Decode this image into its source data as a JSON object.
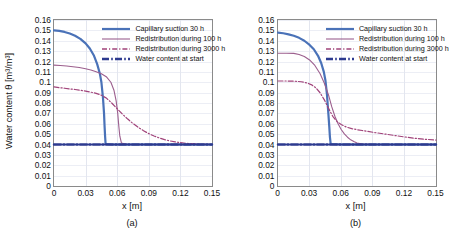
{
  "figure": {
    "axis_titles": {
      "x": "x [m]",
      "y": "Water content θ [m³/m³]"
    },
    "colors": {
      "capillary": "#4a72b8",
      "redistribution100": "#9c5f8e",
      "redistribution3000": "#a0437a",
      "start": "#2d3a8f",
      "frame": "#8a8a8a",
      "grid": "#e3e6ef",
      "background": "#ffffff"
    },
    "legend_entries": [
      {
        "label": "Capillary suction 30 h",
        "key": "capillary",
        "style": "solid-thick"
      },
      {
        "label": "Redistribution during 100 h",
        "key": "redistribution100",
        "style": "solid-thin"
      },
      {
        "label": "Redistribution during 3000 h",
        "key": "redistribution3000",
        "style": "dash-dot"
      },
      {
        "label": "Water content at start",
        "key": "start",
        "style": "dash-dot-thick"
      }
    ],
    "ticks": {
      "y": [
        "0",
        "0.01",
        "0.02",
        "0.03",
        "0.04",
        "0.05",
        "0.06",
        "0.07",
        "0.08",
        "0.09",
        "0.1",
        "0.11",
        "0.12",
        "0.13",
        "0.14",
        "0.15",
        "0.16"
      ],
      "x": [
        "0",
        "0.03",
        "0.06",
        "0.09",
        "0.12",
        "0.15"
      ]
    },
    "captions": {
      "a": "(a)",
      "b": "(b)"
    }
  },
  "chart_data": [
    {
      "type": "line",
      "panel": "(a)",
      "title": "",
      "xlabel": "x [m]",
      "ylabel": "Water content θ [m³/m³]",
      "xlim": [
        0,
        0.15
      ],
      "ylim": [
        0,
        0.16
      ],
      "xticks": [
        0,
        0.03,
        0.06,
        0.09,
        0.12,
        0.15
      ],
      "yticks": [
        0,
        0.01,
        0.02,
        0.03,
        0.04,
        0.05,
        0.06,
        0.07,
        0.08,
        0.09,
        0.1,
        0.11,
        0.12,
        0.13,
        0.14,
        0.15,
        0.16
      ],
      "grid": true,
      "legend_position": "top-right-inside",
      "series": [
        {
          "name": "Capillary suction 30 h",
          "color": "#4a72b8",
          "style": "solid",
          "width": 2.2,
          "x": [
            0,
            0.005,
            0.01,
            0.015,
            0.02,
            0.025,
            0.03,
            0.034,
            0.038,
            0.041,
            0.0435,
            0.045,
            0.0465,
            0.0475,
            0.048,
            0.0485,
            0.049,
            0.055,
            0.07,
            0.09,
            0.11,
            0.13,
            0.15
          ],
          "y": [
            0.15,
            0.1495,
            0.1485,
            0.147,
            0.1448,
            0.1418,
            0.1375,
            0.1325,
            0.1255,
            0.1175,
            0.1085,
            0.1,
            0.085,
            0.07,
            0.058,
            0.048,
            0.0405,
            0.04,
            0.04,
            0.04,
            0.04,
            0.04,
            0.04
          ]
        },
        {
          "name": "Redistribution during 100 h",
          "color": "#9c5f8e",
          "style": "solid",
          "width": 1.1,
          "x": [
            0,
            0.006,
            0.012,
            0.018,
            0.024,
            0.03,
            0.035,
            0.04,
            0.045,
            0.05,
            0.054,
            0.057,
            0.059,
            0.0605,
            0.0615,
            0.0625,
            0.064,
            0.07,
            0.09,
            0.11,
            0.13,
            0.15
          ],
          "y": [
            0.1165,
            0.1162,
            0.1157,
            0.115,
            0.1142,
            0.113,
            0.1118,
            0.1102,
            0.1082,
            0.105,
            0.1,
            0.092,
            0.082,
            0.07,
            0.058,
            0.048,
            0.0415,
            0.04,
            0.04,
            0.04,
            0.04,
            0.04
          ]
        },
        {
          "name": "Redistribution during 3000 h",
          "color": "#a0437a",
          "style": "dashdot",
          "width": 1.2,
          "x": [
            0,
            0.01,
            0.02,
            0.03,
            0.04,
            0.045,
            0.05,
            0.055,
            0.06,
            0.065,
            0.07,
            0.075,
            0.08,
            0.085,
            0.09,
            0.095,
            0.1,
            0.105,
            0.11,
            0.115,
            0.12,
            0.125,
            0.13,
            0.14,
            0.15
          ],
          "y": [
            0.0955,
            0.0942,
            0.093,
            0.0915,
            0.0893,
            0.0875,
            0.0845,
            0.0798,
            0.0745,
            0.0692,
            0.0645,
            0.0602,
            0.0565,
            0.0533,
            0.0505,
            0.0482,
            0.0463,
            0.0447,
            0.0435,
            0.0425,
            0.0418,
            0.0412,
            0.0408,
            0.0402,
            0.04
          ]
        },
        {
          "name": "Water content at start",
          "color": "#2d3a8f",
          "style": "dashdot",
          "width": 2.4,
          "x": [
            0,
            0.15
          ],
          "y": [
            0.04,
            0.04
          ]
        }
      ]
    },
    {
      "type": "line",
      "panel": "(b)",
      "title": "",
      "xlabel": "x [m]",
      "ylabel": "Water content θ [m³/m³]",
      "xlim": [
        0,
        0.15
      ],
      "ylim": [
        0,
        0.16
      ],
      "xticks": [
        0,
        0.03,
        0.06,
        0.09,
        0.12,
        0.15
      ],
      "yticks": [
        0,
        0.01,
        0.02,
        0.03,
        0.04,
        0.05,
        0.06,
        0.07,
        0.08,
        0.09,
        0.1,
        0.11,
        0.12,
        0.13,
        0.14,
        0.15,
        0.16
      ],
      "grid": true,
      "legend_position": "top-right-inside",
      "series": [
        {
          "name": "Capillary suction 30 h",
          "color": "#4a72b8",
          "style": "solid",
          "width": 2.2,
          "x": [
            0,
            0.005,
            0.01,
            0.015,
            0.02,
            0.025,
            0.03,
            0.034,
            0.038,
            0.041,
            0.0435,
            0.045,
            0.0465,
            0.0478,
            0.0487,
            0.0493,
            0.05,
            0.06,
            0.08,
            0.1,
            0.12,
            0.15
          ],
          "y": [
            0.1478,
            0.1472,
            0.1462,
            0.1448,
            0.1428,
            0.14,
            0.136,
            0.1318,
            0.1255,
            0.1185,
            0.11,
            0.102,
            0.088,
            0.07,
            0.057,
            0.047,
            0.0405,
            0.04,
            0.04,
            0.04,
            0.04,
            0.04
          ]
        },
        {
          "name": "Redistribution during 100 h",
          "color": "#9c5f8e",
          "style": "solid",
          "width": 1.1,
          "x": [
            0,
            0.008,
            0.015,
            0.02,
            0.025,
            0.03,
            0.035,
            0.04,
            0.044,
            0.048,
            0.051,
            0.054,
            0.057,
            0.06,
            0.063,
            0.066,
            0.069,
            0.072,
            0.075,
            0.08,
            0.09,
            0.1,
            0.12,
            0.15
          ],
          "y": [
            0.128,
            0.128,
            0.1278,
            0.1268,
            0.1248,
            0.1215,
            0.1162,
            0.1082,
            0.099,
            0.0875,
            0.0765,
            0.0672,
            0.06,
            0.0545,
            0.0502,
            0.047,
            0.0445,
            0.0428,
            0.0415,
            0.0405,
            0.04,
            0.04,
            0.04,
            0.04
          ]
        },
        {
          "name": "Redistribution during 3000 h",
          "color": "#a0437a",
          "style": "dashdot",
          "width": 1.2,
          "x": [
            0,
            0.008,
            0.016,
            0.022,
            0.028,
            0.032,
            0.036,
            0.04,
            0.044,
            0.048,
            0.052,
            0.056,
            0.06,
            0.065,
            0.07,
            0.075,
            0.08,
            0.09,
            0.1,
            0.11,
            0.12,
            0.13,
            0.14,
            0.15
          ],
          "y": [
            0.1012,
            0.1012,
            0.101,
            0.1005,
            0.0992,
            0.0975,
            0.0945,
            0.0898,
            0.083,
            0.0748,
            0.0672,
            0.0622,
            0.0592,
            0.0568,
            0.0553,
            0.0543,
            0.0535,
            0.0518,
            0.0503,
            0.0488,
            0.0473,
            0.046,
            0.045,
            0.0443
          ]
        },
        {
          "name": "Water content at start",
          "color": "#2d3a8f",
          "style": "dashdot",
          "width": 2.4,
          "x": [
            0,
            0.15
          ],
          "y": [
            0.04,
            0.04
          ]
        }
      ]
    }
  ]
}
